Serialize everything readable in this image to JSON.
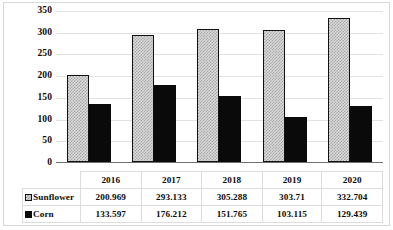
{
  "chart_data": {
    "type": "bar",
    "title": "",
    "subtitle": "",
    "xlabel": "",
    "ylabel": "",
    "categories": [
      "2016",
      "2017",
      "2018",
      "2019",
      "2020"
    ],
    "series": [
      {
        "name": "Sunflower",
        "values": [
          200.969,
          293.133,
          305.288,
          303.71,
          332.704
        ],
        "value_labels": [
          "200.969",
          "293.133",
          "305.288",
          "303.71",
          "332.704"
        ],
        "fill": "#d9d9d9",
        "pattern": "diagonal-crosshatch",
        "legend_key": "hatched-square-icon"
      },
      {
        "name": "Corn",
        "values": [
          133.597,
          176.212,
          151.765,
          103.115,
          129.439
        ],
        "value_labels": [
          "133.597",
          "176.212",
          "151.765",
          "103.115",
          "129.439"
        ],
        "fill": "#0a0a0a",
        "pattern": "solid",
        "legend_key": "solid-black-square-icon"
      }
    ],
    "ylim": [
      0,
      350
    ],
    "yticks": [
      0,
      50,
      100,
      150,
      200,
      250,
      300,
      350
    ],
    "ytick_labels": [
      "0",
      "50",
      "100",
      "150",
      "200",
      "250",
      "300",
      "350"
    ],
    "grid": true,
    "grid_color": "#e2e2e2",
    "legend_position": "data-table-left-column",
    "data_table_visible": true,
    "axis_color": "#6f6f6f",
    "border_color": "#d8d8d8",
    "text_color": "#0b0b0b"
  }
}
